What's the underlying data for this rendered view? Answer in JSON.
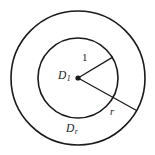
{
  "figure": {
    "type": "geometry-diagram",
    "background_color": "#ffffff",
    "stroke_color": "#1a1a1a",
    "center": {
      "x": 78,
      "y": 78
    },
    "circles": [
      {
        "name": "inner-circle",
        "radius": 40,
        "label": {
          "base": "D",
          "subscript": "1"
        }
      },
      {
        "name": "outer-circle",
        "radius": 67,
        "label": {
          "base": "D",
          "subscript": "r"
        }
      }
    ],
    "radii": [
      {
        "name": "inner-radius",
        "label": "1",
        "angle_degrees": -31,
        "length": 40
      },
      {
        "name": "outer-radius",
        "label": "r",
        "angle_degrees": 29,
        "length": 67
      }
    ],
    "labels": {
      "center_base": "D",
      "center_sub": "1",
      "outer_base": "D",
      "outer_sub": "r",
      "inner_radius_value": "1",
      "outer_radius_value": "r"
    }
  }
}
